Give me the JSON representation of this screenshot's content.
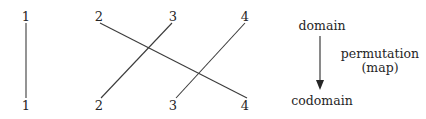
{
  "figure": {
    "kind": "permutation-two-line-wire-diagram",
    "width": 426,
    "height": 119,
    "background_color": "#ffffff",
    "ink_color": "#262626"
  },
  "diagram": {
    "domain_row": {
      "label_y": 16,
      "nodes": [
        {
          "label": "1",
          "x": 26
        },
        {
          "label": "2",
          "x": 99
        },
        {
          "label": "3",
          "x": 173
        },
        {
          "label": "4",
          "x": 245
        }
      ]
    },
    "codomain_row": {
      "label_y": 105,
      "nodes": [
        {
          "label": "1",
          "x": 26
        },
        {
          "label": "2",
          "x": 99
        },
        {
          "label": "3",
          "x": 173
        },
        {
          "label": "4",
          "x": 245
        }
      ]
    },
    "mapping": [
      {
        "from": "1",
        "to": "1"
      },
      {
        "from": "2",
        "to": "4"
      },
      {
        "from": "3",
        "to": "2"
      },
      {
        "from": "4",
        "to": "3"
      }
    ],
    "wires": [
      {
        "name": "wire-1-to-1",
        "from": "1",
        "to": "1",
        "x1": 26,
        "y1": 23,
        "x2": 26,
        "y2": 98
      },
      {
        "name": "wire-2-to-4",
        "from": "2",
        "to": "4",
        "x1": 100,
        "y1": 23,
        "x2": 247,
        "y2": 98
      },
      {
        "name": "wire-3-to-2",
        "from": "3",
        "to": "2",
        "x1": 172,
        "y1": 23,
        "x2": 101,
        "y2": 98
      },
      {
        "name": "wire-4-to-3",
        "from": "4",
        "to": "3",
        "x1": 245,
        "y1": 23,
        "x2": 176,
        "y2": 98
      }
    ],
    "crossings": [
      {
        "x": 150,
        "y": 51
      },
      {
        "x": 201,
        "y": 76
      }
    ]
  },
  "annotation": {
    "domain_label": "domain",
    "domain_label_x": 322,
    "domain_label_y": 20,
    "codomain_label": "codomain",
    "codomain_label_x": 322,
    "codomain_label_y": 95,
    "arrow": {
      "name": "permutation-arrow",
      "x": 320,
      "y1": 36,
      "y2": 89,
      "head": "filled-triangle-down"
    },
    "arrow_caption_line1": "permutation",
    "arrow_caption_line2": "(map)",
    "arrow_caption_x": 380,
    "arrow_caption_y": 48
  }
}
